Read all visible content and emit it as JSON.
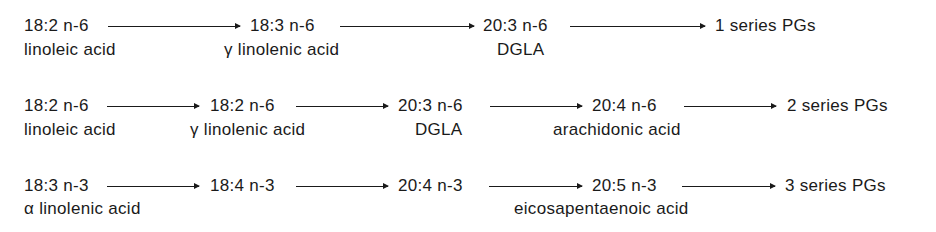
{
  "pathways": [
    {
      "nodes": [
        {
          "formula": "18:2 n-6",
          "name": "linoleic acid"
        },
        {
          "formula": "18:3 n-6",
          "name": "γ linolenic acid"
        },
        {
          "formula": "20:3 n-6",
          "name": "DGLA"
        },
        {
          "formula": "1 series PGs",
          "name": ""
        }
      ]
    },
    {
      "nodes": [
        {
          "formula": "18:2 n-6",
          "name": "linoleic acid"
        },
        {
          "formula": "18:2 n-6",
          "name": "γ linolenic acid"
        },
        {
          "formula": "20:3 n-6",
          "name": "DGLA"
        },
        {
          "formula": "20:4 n-6",
          "name": "arachidonic acid"
        },
        {
          "formula": "2 series PGs",
          "name": ""
        }
      ]
    },
    {
      "nodes": [
        {
          "formula": "18:3 n-3",
          "name": "α linolenic acid"
        },
        {
          "formula": "18:4 n-3",
          "name": ""
        },
        {
          "formula": "20:4 n-3",
          "name": ""
        },
        {
          "formula": "20:5 n-3",
          "name": "eicosapentaenoic acid"
        },
        {
          "formula": "3 series PGs",
          "name": ""
        }
      ]
    }
  ]
}
